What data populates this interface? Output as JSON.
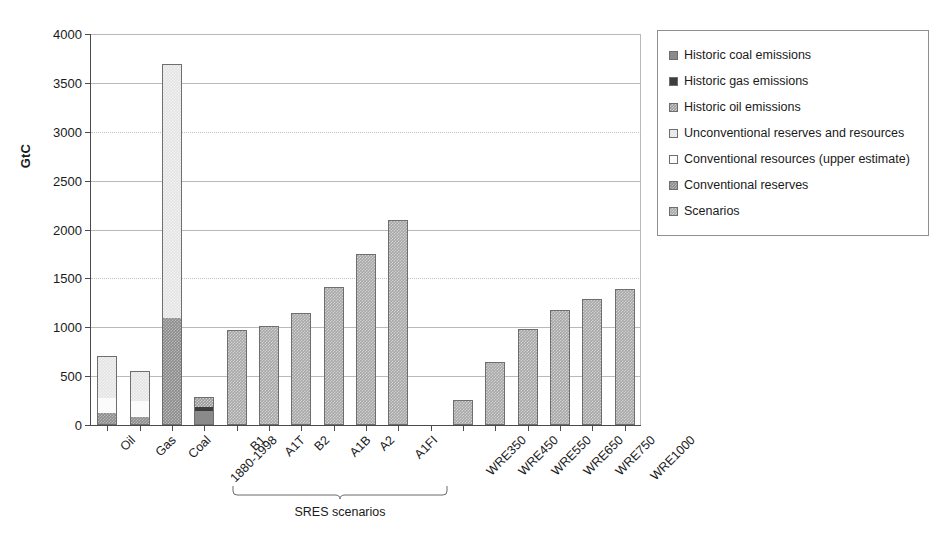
{
  "chart_data": {
    "type": "bar",
    "title": "",
    "subtitle": "",
    "xlabel": "",
    "ylabel": "GtC",
    "ylim": [
      0,
      4000
    ],
    "yticks": [
      0,
      500,
      1000,
      1500,
      2000,
      2500,
      3000,
      3500,
      4000
    ],
    "grid": true,
    "legend_position": "right",
    "stacked": true,
    "categories": [
      "Oil",
      "Gas",
      "Coal",
      "1880-1998",
      "B1",
      "A1T",
      "B2",
      "A1B",
      "A2",
      "A1FI",
      "",
      "WRE350",
      "WRE450",
      "WRE550",
      "WRE650",
      "WRE750",
      "WRE1000"
    ],
    "series": [
      {
        "name": "Conventional reserves",
        "key": "conventional_reserves",
        "color": "#8c8c8c",
        "values": [
          120,
          70,
          1090,
          null,
          null,
          null,
          null,
          null,
          null,
          null,
          null,
          null,
          null,
          null,
          null,
          null,
          null
        ]
      },
      {
        "name": "Conventional resources (upper estimate)",
        "key": "conventional_resources",
        "color": "#fbfbfb",
        "values": [
          155,
          180,
          0,
          null,
          null,
          null,
          null,
          null,
          null,
          null,
          null,
          null,
          null,
          null,
          null,
          null,
          null
        ]
      },
      {
        "name": "Unconventional reserves and resources",
        "key": "unconventional",
        "color": "#e3e3e3",
        "values": [
          435,
          300,
          2600,
          null,
          null,
          null,
          null,
          null,
          null,
          null,
          null,
          null,
          null,
          null,
          null,
          null,
          null
        ]
      },
      {
        "name": "Historic oil emissions",
        "key": "historic_oil",
        "color": "#9a9a9a",
        "values": [
          null,
          null,
          null,
          100,
          null,
          null,
          null,
          null,
          null,
          null,
          null,
          null,
          null,
          null,
          null,
          null,
          null
        ]
      },
      {
        "name": "Historic gas emissions",
        "key": "historic_gas",
        "color": "#3d3d3d",
        "values": [
          null,
          null,
          null,
          45,
          null,
          null,
          null,
          null,
          null,
          null,
          null,
          null,
          null,
          null,
          null,
          null,
          null
        ]
      },
      {
        "name": "Historic coal emissions",
        "key": "historic_coal",
        "color": "#8a8a8a",
        "values": [
          null,
          null,
          null,
          145,
          null,
          null,
          null,
          null,
          null,
          null,
          null,
          null,
          null,
          null,
          null,
          null,
          null
        ]
      },
      {
        "name": "Scenarios",
        "key": "scenarios",
        "color": "#a8a8a8",
        "values": [
          null,
          null,
          null,
          null,
          975,
          1015,
          1145,
          1410,
          1750,
          2095,
          null,
          260,
          640,
          980,
          1175,
          1290,
          1390
        ]
      }
    ],
    "totals": [
      710,
      550,
      3690,
      290,
      975,
      1015,
      1145,
      1410,
      1750,
      2095,
      null,
      260,
      640,
      980,
      1175,
      1290,
      1390
    ],
    "annotations": [
      {
        "text": "SRES scenarios",
        "covers": [
          "B1",
          "A1T",
          "B2",
          "A1B",
          "A2",
          "A1FI"
        ],
        "type": "bracket"
      }
    ]
  },
  "axis": {
    "y_title": "GtC",
    "y_tick_labels": [
      "0",
      "500",
      "1000",
      "1500",
      "2000",
      "2500",
      "3000",
      "3500",
      "4000"
    ],
    "x_tick_labels": [
      "Oil",
      "Gas",
      "Coal",
      "1880-1998",
      "B1",
      "A1T",
      "B2",
      "A1B",
      "A2",
      "A1FI",
      "",
      "WRE350",
      "WRE450",
      "WRE550",
      "WRE650",
      "WRE750",
      "WRE1000"
    ]
  },
  "bracket": {
    "caption": "SRES scenarios"
  },
  "legend": {
    "items": [
      {
        "label": "Historic coal emissions",
        "key": "historic_coal"
      },
      {
        "label": "Historic gas emissions",
        "key": "historic_gas"
      },
      {
        "label": "Historic oil emissions",
        "key": "historic_oil"
      },
      {
        "label": "Unconventional reserves and resources",
        "key": "unconventional"
      },
      {
        "label": "Conventional resources (upper estimate)",
        "key": "conventional_resources"
      },
      {
        "label": "Conventional reserves",
        "key": "conventional_reserves"
      },
      {
        "label": "Scenarios",
        "key": "scenarios"
      }
    ]
  }
}
